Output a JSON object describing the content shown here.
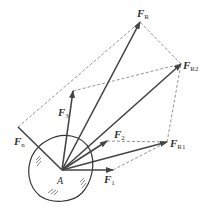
{
  "diagram": {
    "origin_label": "A",
    "colors": {
      "stroke": "#444444",
      "dashed": "#777777",
      "text": "#333333"
    },
    "forces": [
      {
        "id": "F1",
        "symbol": "F",
        "sub": "1"
      },
      {
        "id": "F2",
        "symbol": "F",
        "sub": "2"
      },
      {
        "id": "F3",
        "symbol": "F",
        "sub": "3"
      },
      {
        "id": "Fn",
        "symbol": "F",
        "sub": "n"
      },
      {
        "id": "FR1",
        "symbol": "F",
        "sub": "R1"
      },
      {
        "id": "FR2",
        "symbol": "F",
        "sub": "R2"
      },
      {
        "id": "FR",
        "symbol": "F",
        "sub": "R"
      }
    ]
  }
}
